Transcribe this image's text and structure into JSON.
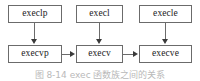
{
  "diagram": {
    "nodes": [
      {
        "id": "execlp",
        "label": "execlp",
        "row": "top",
        "column": 1
      },
      {
        "id": "execl",
        "label": "execl",
        "row": "top",
        "column": 2
      },
      {
        "id": "execle",
        "label": "execle",
        "row": "top",
        "column": 3
      },
      {
        "id": "execvp",
        "label": "execvp",
        "row": "bottom",
        "column": 1
      },
      {
        "id": "execv",
        "label": "execv",
        "row": "bottom",
        "column": 2
      },
      {
        "id": "execve",
        "label": "execve",
        "row": "bottom",
        "column": 3
      }
    ],
    "edges": [
      {
        "from": "execlp",
        "to": "execvp",
        "direction": "down"
      },
      {
        "from": "execl",
        "to": "execv",
        "direction": "down"
      },
      {
        "from": "execle",
        "to": "execve",
        "direction": "down"
      },
      {
        "from": "execvp",
        "to": "execv",
        "direction": "right"
      },
      {
        "from": "execv",
        "to": "execve",
        "direction": "right"
      }
    ],
    "colors": {
      "box_border": "#6b6b6b",
      "box_fill": "#ffffff",
      "text": "#1a1a1a",
      "connector": "#6b6b6b",
      "arrow_head": "#3a3a3a"
    }
  },
  "caption": {
    "text": "图 8-14 exec 函数族之间的关系"
  }
}
